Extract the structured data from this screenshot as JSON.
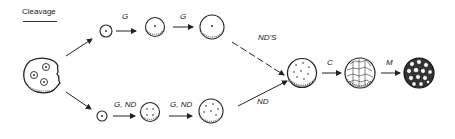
{
  "title": "Cleavage",
  "labels": {
    "top_1": "G",
    "top_2": "G",
    "top_merge": "ND'S",
    "bottom_1": "G, ND",
    "bottom_2": "G, ND",
    "bottom_merge": "ND",
    "final_1": "C",
    "final_2": "M"
  },
  "colors": {
    "ink": "#222222",
    "background": "#ffffff"
  }
}
